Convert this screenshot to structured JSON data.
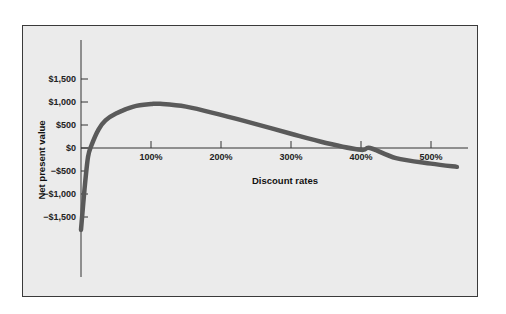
{
  "chart_data": {
    "type": "line",
    "title": "",
    "xlabel": "Discount rates",
    "ylabel": "Net present value",
    "x_ticks": [
      "100%",
      "200%",
      "300%",
      "400%",
      "500%"
    ],
    "y_ticks": [
      "$1,500",
      "$1,000",
      "$500",
      "$0",
      "−$500",
      "−$1,000",
      "−$1,500"
    ],
    "xlim": [
      0,
      550
    ],
    "ylim": [
      -2800,
      2350
    ],
    "grid": false,
    "legend": null,
    "series": [
      {
        "name": "NPV profile",
        "color": "#5a5a5a",
        "x": [
          0,
          5,
          10,
          15,
          25,
          35,
          50,
          75,
          100,
          113,
          150,
          200,
          250,
          300,
          350,
          400,
          413,
          450,
          500,
          537
        ],
        "y": [
          -1780,
          -900,
          -200,
          60,
          400,
          600,
          750,
          900,
          955,
          960,
          900,
          720,
          520,
          310,
          110,
          -40,
          0,
          -220,
          -340,
          -410
        ]
      }
    ]
  },
  "labels": {
    "x_axis_title": "Discount rates",
    "y_axis_title": "Net present value"
  }
}
